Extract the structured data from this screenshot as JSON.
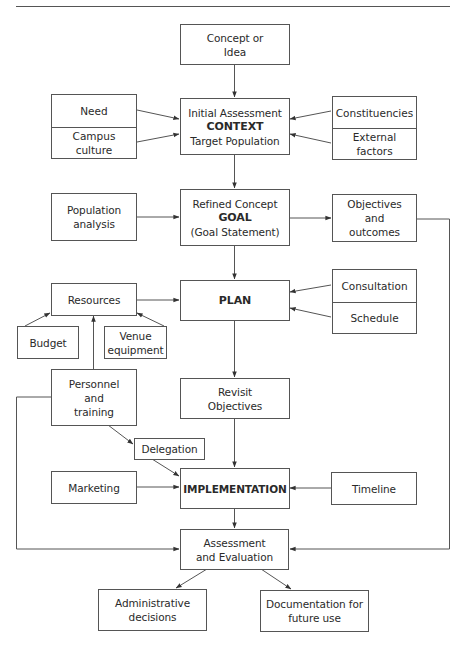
{
  "nodes": {
    "concept": {
      "line1": "Concept or",
      "line2": "Idea"
    },
    "initial_assessment": {
      "line1": "Initial Assessment",
      "bold": "CONTEXT",
      "line3": "Target Population"
    },
    "need": "Need",
    "campus_culture": {
      "line1": "Campus",
      "line2": "culture"
    },
    "constituencies": "Constituencies",
    "external_factors": {
      "line1": "External",
      "line2": "factors"
    },
    "population_analysis": {
      "line1": "Population",
      "line2": "analysis"
    },
    "refined_concept": {
      "line1": "Refined Concept",
      "bold": "GOAL",
      "line3": "(Goal Statement)"
    },
    "objectives_outcomes": {
      "line1": "Objectives",
      "line2": "and",
      "line3": "outcomes"
    },
    "resources": "Resources",
    "plan": "PLAN",
    "consultation": "Consultation",
    "schedule": "Schedule",
    "budget": "Budget",
    "venue_equipment": {
      "line1": "Venue",
      "line2": "equipment"
    },
    "personnel_training": {
      "line1": "Personnel",
      "line2": "and",
      "line3": "training"
    },
    "revisit_objectives": {
      "line1": "Revisit",
      "line2": "Objectives"
    },
    "delegation": "Delegation",
    "marketing": "Marketing",
    "implementation": "IMPLEMENTATION",
    "timeline": "Timeline",
    "assessment_evaluation": {
      "line1": "Assessment",
      "line2": "and Evaluation"
    },
    "administrative_decisions": {
      "line1": "Administrative",
      "line2": "decisions"
    },
    "documentation": {
      "line1": "Documentation for",
      "line2": "future use"
    }
  },
  "edges": [
    [
      "concept",
      "initial_assessment"
    ],
    [
      "need",
      "initial_assessment"
    ],
    [
      "campus_culture",
      "initial_assessment"
    ],
    [
      "constituencies",
      "initial_assessment"
    ],
    [
      "external_factors",
      "initial_assessment"
    ],
    [
      "initial_assessment",
      "refined_concept"
    ],
    [
      "population_analysis",
      "refined_concept"
    ],
    [
      "refined_concept",
      "objectives_outcomes"
    ],
    [
      "refined_concept",
      "plan"
    ],
    [
      "objectives_outcomes",
      "assessment_evaluation"
    ],
    [
      "resources",
      "plan"
    ],
    [
      "consultation",
      "plan"
    ],
    [
      "schedule",
      "plan"
    ],
    [
      "budget",
      "resources"
    ],
    [
      "venue_equipment",
      "resources"
    ],
    [
      "personnel_training",
      "resources"
    ],
    [
      "personnel_training",
      "delegation"
    ],
    [
      "personnel_training",
      "assessment_evaluation"
    ],
    [
      "plan",
      "revisit_objectives"
    ],
    [
      "revisit_objectives",
      "implementation"
    ],
    [
      "delegation",
      "implementation"
    ],
    [
      "marketing",
      "implementation"
    ],
    [
      "timeline",
      "implementation"
    ],
    [
      "implementation",
      "assessment_evaluation"
    ],
    [
      "assessment_evaluation",
      "administrative_decisions"
    ],
    [
      "assessment_evaluation",
      "documentation"
    ]
  ]
}
